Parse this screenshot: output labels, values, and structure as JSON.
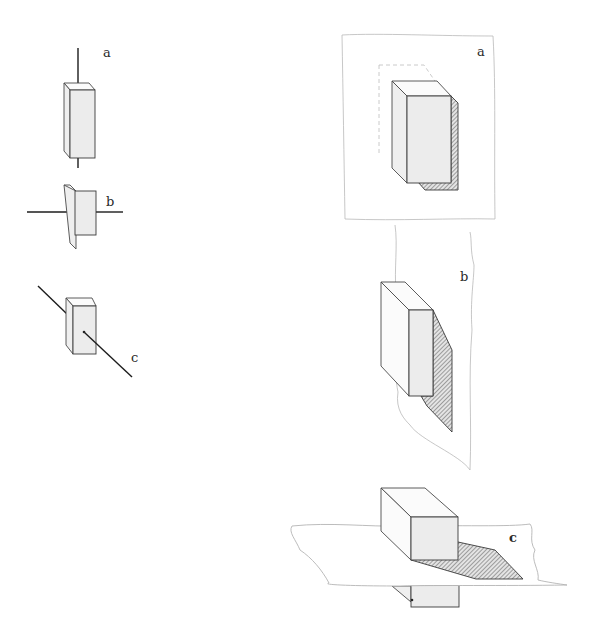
{
  "figure": {
    "left_column": {
      "items": [
        {
          "id": "a",
          "label": "a",
          "caption": "block pierced by vertical axis"
        },
        {
          "id": "b",
          "label": "b",
          "caption": "block pierced by horizontal axis"
        },
        {
          "id": "c",
          "label": "c",
          "caption": "block pierced by oblique axis"
        }
      ]
    },
    "right_column": {
      "items": [
        {
          "id": "a",
          "label": "a",
          "caption": "block against vertical frontal plane with cast shadow"
        },
        {
          "id": "b",
          "label": "b",
          "caption": "block against vertical profile plane with cast shadow"
        },
        {
          "id": "c",
          "label": "c",
          "caption": "block through horizontal plane with cast shadow"
        }
      ]
    },
    "colors": {
      "ink": "#3a3a3a",
      "faint_line": "#b9b9b9",
      "face_fill": "#ececec",
      "background": "#ffffff"
    }
  }
}
